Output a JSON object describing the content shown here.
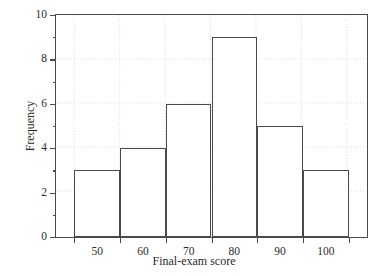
{
  "chart_data": {
    "type": "bar",
    "title": "",
    "subtitle": "",
    "xlabel": "Final-exam score",
    "ylabel": "Frequency",
    "categories": [
      "45-55",
      "55-65",
      "65-75",
      "75-85",
      "85-95",
      "95-105"
    ],
    "bin_edges": [
      45,
      55,
      65,
      75,
      85,
      95,
      105
    ],
    "values": [
      3,
      4,
      6,
      9,
      5,
      3
    ],
    "xlim": [
      41,
      109
    ],
    "ylim": [
      0,
      10
    ],
    "x_ticks": [
      45,
      55,
      65,
      75,
      85,
      95,
      105
    ],
    "x_tick_labels": [
      "50",
      "60",
      "70",
      "80",
      "90",
      "100"
    ],
    "x_tick_label_positions": [
      50,
      60,
      70,
      80,
      90,
      100
    ],
    "y_ticks_major": [
      0,
      2,
      4,
      6,
      8,
      10
    ],
    "y_tick_labels": [
      "0",
      "2",
      "4",
      "6",
      "8",
      "10"
    ],
    "y_ticks_minor": [
      1,
      3,
      5,
      7,
      9
    ],
    "grid": true,
    "grid_style": "dotted",
    "legend": null,
    "annotations": [],
    "colors": {
      "bar_fill": "#ffffff",
      "bar_edge": "#4a4a4a",
      "axis": "#4a4a4a",
      "grid": "#cfcfcf",
      "text": "#2b2b2b",
      "background": "#ffffff"
    }
  }
}
